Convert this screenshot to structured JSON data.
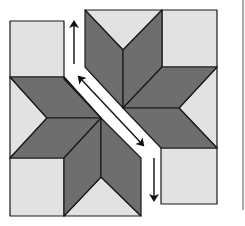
{
  "diagram": {
    "colors": {
      "background": "#ffffff",
      "light_patch": "#e2e2e2",
      "dark_diamond": "#6e6e6e",
      "outline": "#1a1a1a",
      "arrow": "#111111"
    },
    "halves": [
      {
        "name": "left-half",
        "diamonds": 4,
        "corner_squares": 2,
        "side_triangles": 2
      },
      {
        "name": "right-half",
        "diamonds": 4,
        "corner_squares": 2,
        "side_triangles": 2
      }
    ],
    "arrows": [
      {
        "name": "up-arrow",
        "direction": "up"
      },
      {
        "name": "diagonal-double-arrow",
        "direction": "both"
      },
      {
        "name": "down-arrow",
        "direction": "down"
      }
    ]
  }
}
